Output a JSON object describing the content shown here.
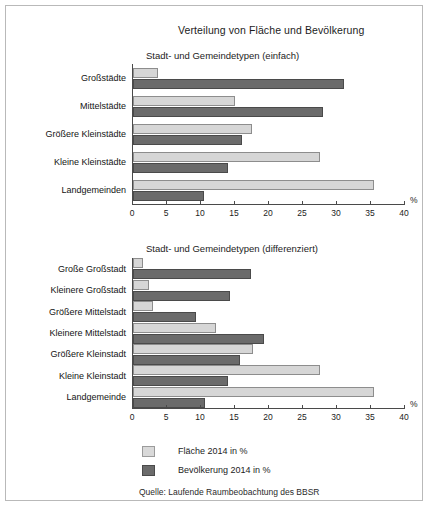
{
  "figure": {
    "title": "Verteilung von Fläche und Bevölkerung",
    "source": "Quelle: Laufende Raumbeobachtung des BBSR",
    "axis_unit": "%",
    "colors": {
      "flaeche": "#d9d9d9",
      "bevoelkerung": "#6b6b6b",
      "axis": "#4a4a4a",
      "frame": "#b9b9b9"
    }
  },
  "legend": {
    "position": "bottom-left",
    "entries": [
      {
        "label": "Fläche 2014 in %",
        "key": "flaeche",
        "color": "#d9d9d9"
      },
      {
        "label": "Bevölkerung 2014 in %",
        "key": "bevoelkerung",
        "color": "#6b6b6b"
      }
    ]
  },
  "chart_data": [
    {
      "id": "chart-1",
      "type": "bar",
      "orientation": "horizontal",
      "title": "Stadt- und Gemeindetypen (einfach)",
      "xlabel": "%",
      "ylabel": "",
      "xlim": [
        0,
        40
      ],
      "xticks": [
        0,
        5,
        10,
        15,
        20,
        25,
        30,
        35,
        40
      ],
      "xtick_labels": [
        "0",
        "5",
        "10",
        "15",
        "20",
        "25",
        "30",
        "35",
        "40"
      ],
      "grid": false,
      "categories": [
        "Großstädte",
        "Mittelstädte",
        "Größere Kleinstädte",
        "Kleine Kleinstädte",
        "Landgemeinden"
      ],
      "series": [
        {
          "name": "Fläche 2014 in %",
          "key": "flaeche",
          "values": [
            3.7,
            15.0,
            17.5,
            27.5,
            35.5
          ]
        },
        {
          "name": "Bevölkerung 2014 in %",
          "key": "bevoelkerung",
          "values": [
            31.0,
            28.0,
            16.0,
            14.0,
            10.5
          ]
        }
      ]
    },
    {
      "id": "chart-2",
      "type": "bar",
      "orientation": "horizontal",
      "title": "Stadt- und Gemeindetypen (differenziert)",
      "xlabel": "%",
      "ylabel": "",
      "xlim": [
        0,
        40
      ],
      "xticks": [
        0,
        5,
        10,
        15,
        20,
        25,
        30,
        35,
        40
      ],
      "xtick_labels": [
        "0",
        "5",
        "10",
        "15",
        "20",
        "25",
        "30",
        "35",
        "40"
      ],
      "grid": false,
      "categories": [
        "Große Großstadt",
        "Kleinere Großstadt",
        "Größere Mittelstadt",
        "Kleinere Mittelstadt",
        "Größere Kleinstadt",
        "Kleine Kleinstadt",
        "Landgemeinde"
      ],
      "series": [
        {
          "name": "Fläche 2014 in %",
          "key": "flaeche",
          "values": [
            1.5,
            2.3,
            3.0,
            12.2,
            17.6,
            27.5,
            35.5
          ]
        },
        {
          "name": "Bevölkerung 2014 in %",
          "key": "bevoelkerung",
          "values": [
            17.3,
            14.2,
            9.2,
            19.2,
            15.8,
            14.0,
            10.6
          ]
        }
      ]
    }
  ]
}
